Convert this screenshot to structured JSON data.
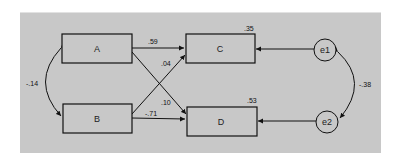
{
  "diagram": {
    "type": "path-model",
    "background": "#c8c8c8",
    "nodes": [
      {
        "id": "A",
        "label": "A",
        "shape": "rect"
      },
      {
        "id": "B",
        "label": "B",
        "shape": "rect"
      },
      {
        "id": "C",
        "label": "C",
        "shape": "rect",
        "r2": ".35"
      },
      {
        "id": "D",
        "label": "D",
        "shape": "rect",
        "r2": ".53"
      },
      {
        "id": "e1",
        "label": "e1",
        "shape": "circle"
      },
      {
        "id": "e2",
        "label": "e2",
        "shape": "circle"
      }
    ],
    "paths": [
      {
        "from": "A",
        "to": "C",
        "coef": ".59"
      },
      {
        "from": "B",
        "to": "C",
        "coef": ".04"
      },
      {
        "from": "A",
        "to": "D",
        "coef": ".10"
      },
      {
        "from": "B",
        "to": "D",
        "coef": "-.71"
      },
      {
        "from": "e1",
        "to": "C",
        "coef": ""
      },
      {
        "from": "e2",
        "to": "D",
        "coef": ""
      }
    ],
    "covariances": [
      {
        "between": [
          "A",
          "B"
        ],
        "coef": "-.14"
      },
      {
        "between": [
          "e1",
          "e2"
        ],
        "coef": "-.38"
      }
    ]
  }
}
